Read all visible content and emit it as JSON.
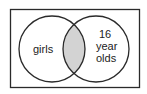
{
  "diagram": {
    "type": "venn",
    "sets": [
      {
        "label": "girls"
      },
      {
        "label_lines": [
          "16",
          "year",
          "olds"
        ]
      }
    ],
    "shaded_region": "intersection",
    "colors": {
      "outline": "#2a2a2a",
      "shade": "#d3d3d3",
      "background": "#ffffff"
    }
  }
}
